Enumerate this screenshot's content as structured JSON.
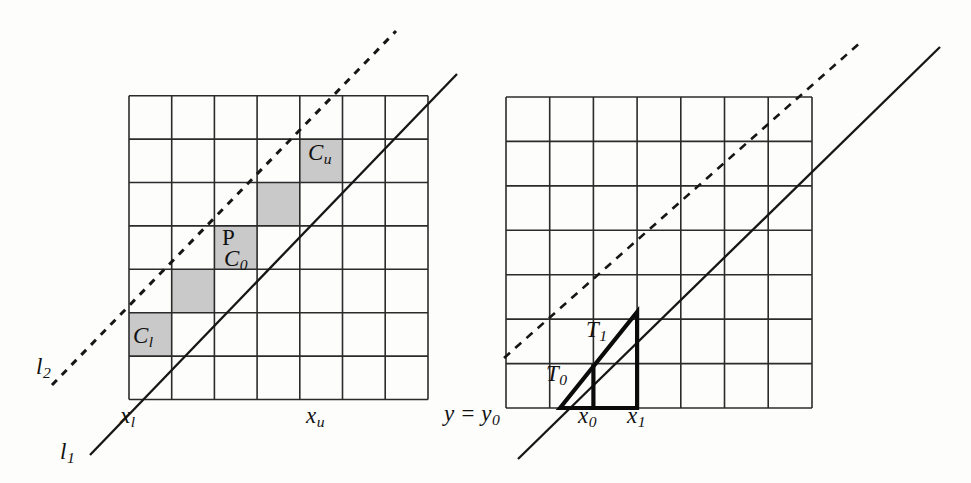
{
  "figure": {
    "background_color": "#fdfdfc",
    "ink_color": "#1a1a1a",
    "shade_color": "#c9c9c9"
  },
  "left_panel": {
    "name": "cell-bounds-diagram",
    "grid": {
      "cols": 7,
      "rows": 7
    },
    "shaded_cells": [
      {
        "label": "C_l",
        "col": 0,
        "row": 5
      },
      {
        "label": "",
        "col": 1,
        "row": 4
      },
      {
        "label": "C_0",
        "col": 2,
        "row": 3
      },
      {
        "label": "",
        "col": 3,
        "row": 2
      },
      {
        "label": "C_u",
        "col": 4,
        "row": 1
      }
    ],
    "labels": {
      "l1": {
        "base": "l",
        "sub": "1"
      },
      "l2": {
        "base": "l",
        "sub": "2"
      },
      "xl": {
        "base": "x",
        "sub": "l"
      },
      "xu": {
        "base": "x",
        "sub": "u"
      },
      "P": {
        "base": "P",
        "sub": ""
      },
      "C0": {
        "base": "C",
        "sub": "0"
      },
      "Cl": {
        "base": "C",
        "sub": "l"
      },
      "Cu": {
        "base": "C",
        "sub": "u"
      }
    },
    "lines": [
      {
        "name": "l1",
        "style": "solid"
      },
      {
        "name": "l2",
        "style": "dashed"
      }
    ]
  },
  "right_panel": {
    "name": "trapezoid-decomposition-diagram",
    "grid": {
      "cols": 7,
      "rows": 7
    },
    "labels": {
      "y_eq_y0": {
        "base": "y = y",
        "sub": "0"
      },
      "x0": {
        "base": "x",
        "sub": "0"
      },
      "x1": {
        "base": "x",
        "sub": "1"
      },
      "T0": {
        "base": "T",
        "sub": "0"
      },
      "T1": {
        "base": "T",
        "sub": "1"
      }
    },
    "lines": [
      {
        "name": "solid-line",
        "style": "solid"
      },
      {
        "name": "dashed-line",
        "style": "dashed"
      }
    ],
    "triangle": {
      "name": "bold-triangle",
      "stroke_width": 4
    }
  }
}
